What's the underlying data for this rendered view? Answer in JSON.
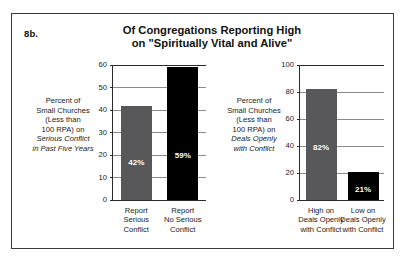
{
  "figure": {
    "number": "8b.",
    "title_lines": [
      "Of Congregations Reporting High",
      "on \"Spiritually Vital and Alive\""
    ],
    "colors": {
      "gray_bar": "#58585a",
      "black_bar": "#000000",
      "gridline": "#8b8b8b",
      "axis": "#2b2b2b",
      "background": "#ffffff",
      "frame": "#3a3a3a"
    }
  },
  "chart_data": [
    {
      "type": "bar",
      "title": "Of Congregations Reporting High on \"Spiritually Vital and Alive\"",
      "panel": "left",
      "categories": [
        "Report Serious Conflict",
        "Report No Serious Conflict"
      ],
      "category_lines": [
        [
          "Report",
          "Serious",
          "Conflict"
        ],
        [
          "Report",
          "No Serious",
          "Conflict"
        ]
      ],
      "values": [
        42,
        59
      ],
      "value_labels": [
        "42%",
        "59%"
      ],
      "bar_colors": [
        "#58585a",
        "#000000"
      ],
      "ylabel_lines": [
        "Percent of",
        "Small Churches",
        "(Less than",
        "100 RPA) on",
        "Serious Conflict",
        "in Past Five Years"
      ],
      "ylabel_italic_from": 4,
      "xlabel": "",
      "ylim": [
        0,
        60
      ],
      "yticks": [
        0,
        10,
        20,
        30,
        40,
        50,
        60
      ],
      "ytick_labels": [
        "0",
        "10",
        "20",
        "30",
        "40",
        "50",
        "60"
      ],
      "grid": true,
      "legend": "none"
    },
    {
      "type": "bar",
      "title": "Of Congregations Reporting High on \"Spiritually Vital and Alive\"",
      "panel": "right",
      "categories": [
        "High on Deals Openly with Conflict",
        "Low on Deals Openly with Conflict"
      ],
      "category_lines": [
        [
          "High on",
          "Deals Openly",
          "with Conflict"
        ],
        [
          "Low on",
          "Deals Openly",
          "with Conflict"
        ]
      ],
      "values": [
        82,
        21
      ],
      "value_labels": [
        "82%",
        "21%"
      ],
      "bar_colors": [
        "#58585a",
        "#000000"
      ],
      "ylabel_lines": [
        "Percent of",
        "Small Churches",
        "(Less than",
        "100 RPA) on",
        "Deals Openly",
        "with Conflict"
      ],
      "ylabel_italic_from": 4,
      "xlabel": "",
      "ylim": [
        0,
        100
      ],
      "yticks": [
        0,
        20,
        40,
        60,
        80,
        100
      ],
      "ytick_labels": [
        "0",
        "20",
        "40",
        "60",
        "80",
        "100"
      ],
      "grid": true,
      "legend": "none"
    }
  ]
}
